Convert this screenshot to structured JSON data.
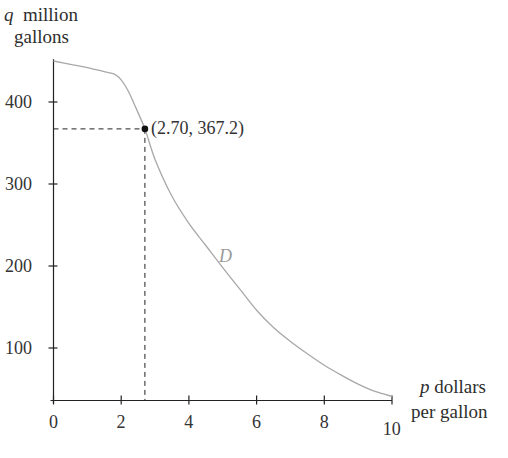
{
  "chart_data": {
    "type": "line",
    "title": "",
    "ylabel": {
      "var": "q",
      "unit_line1": "million",
      "unit_line2": "gallons"
    },
    "xlabel": {
      "var": "p",
      "unit_line1": "dollars",
      "unit_line2": "per gallon"
    },
    "xlim": [
      0,
      10
    ],
    "ylim": [
      37,
      460
    ],
    "x_ticks": [
      0,
      2,
      4,
      6,
      8,
      10
    ],
    "y_ticks": [
      100,
      200,
      300,
      400
    ],
    "grid": false,
    "legend": "none",
    "series": [
      {
        "name": "D",
        "color": "#a8a8a8",
        "x": [
          0,
          0.5,
          1.0,
          1.5,
          1.8,
          2.0,
          2.2,
          2.4,
          2.7,
          3.0,
          3.5,
          4.0,
          4.5,
          5.0,
          5.5,
          6.0,
          6.5,
          7.0,
          7.5,
          8.0,
          8.5,
          9.0,
          9.5,
          10.0
        ],
        "y": [
          450,
          446,
          442,
          437,
          434,
          427,
          414,
          396,
          367.2,
          330,
          285,
          252,
          225,
          198,
          172,
          146,
          125,
          108,
          93,
          79,
          67,
          56,
          47,
          41
        ]
      }
    ],
    "annotations": [
      {
        "type": "point",
        "x": 2.7,
        "y": 367.2,
        "label": "(2.70, 367.2)",
        "dashed_guides": true
      }
    ]
  }
}
